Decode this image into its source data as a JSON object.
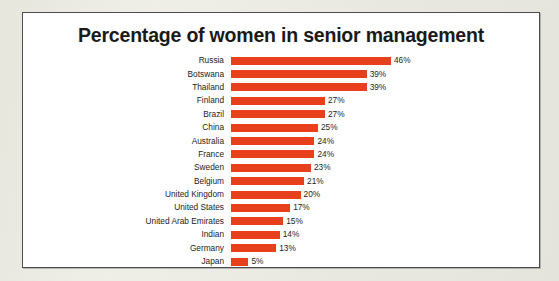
{
  "chart_data": {
    "type": "bar",
    "orientation": "horizontal",
    "title": "Percentage of women in senior management",
    "xlabel": "",
    "ylabel": "",
    "xlim": [
      0,
      46
    ],
    "grid": false,
    "legend": null,
    "value_suffix": "%",
    "bar_color": "#e8401c",
    "categories": [
      "Russia",
      "Botswana",
      "Thailand",
      "Finland",
      "Brazil",
      "China",
      "Australia",
      "France",
      "Sweden",
      "Belgium",
      "United Kingdom",
      "United States",
      "United Arab Emirates",
      "Indian",
      "Germany",
      "Japan"
    ],
    "values": [
      46,
      39,
      39,
      27,
      27,
      25,
      24,
      24,
      23,
      21,
      20,
      17,
      15,
      14,
      13,
      5
    ],
    "value_labels": [
      "46%",
      "39%",
      "39%",
      "27%",
      "27%",
      "25%",
      "24%",
      "24%",
      "23%",
      "21%",
      "20%",
      "17%",
      "15%",
      "14%",
      "13%",
      "5%"
    ]
  }
}
